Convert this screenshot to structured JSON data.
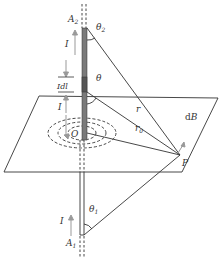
{
  "diagram": {
    "labels": {
      "a2": "A",
      "a2_sub": "2",
      "a1": "A",
      "a1_sub": "1",
      "theta2": "θ",
      "theta2_sub": "2",
      "theta": "θ",
      "theta1": "θ",
      "theta1_sub": "1",
      "current_top": "I",
      "current_mid": "I",
      "current_bottom": "I",
      "element": "Idl",
      "r": "r",
      "r0": "r",
      "r0_sub": "0",
      "origin": "O",
      "point": "P",
      "field_d": "d",
      "field_b": "B"
    },
    "colors": {
      "line": "#333333",
      "wire_fill": "#7a7a7a",
      "element_fill": "#555555",
      "arrow": "#999999"
    }
  }
}
